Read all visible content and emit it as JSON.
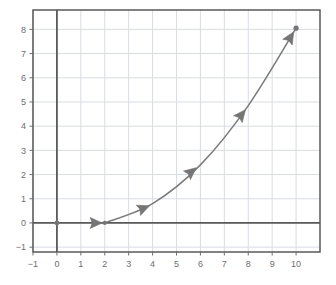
{
  "chart_data": {
    "type": "line",
    "title": "",
    "xlabel": "",
    "ylabel": "",
    "xlim": [
      -1,
      11
    ],
    "ylim": [
      -1.2,
      8.8
    ],
    "xticks": [
      -1,
      0,
      1,
      2,
      3,
      4,
      5,
      6,
      7,
      8,
      9,
      10
    ],
    "yticks": [
      -1,
      0,
      1,
      2,
      3,
      4,
      5,
      6,
      7,
      8
    ],
    "xtick_labels": [
      "−1",
      "0",
      "1",
      "2",
      "3",
      "4",
      "5",
      "6",
      "7",
      "8",
      "9",
      "10"
    ],
    "ytick_labels": [
      "−1",
      "0",
      "1",
      "2",
      "3",
      "4",
      "5",
      "6",
      "7",
      "8"
    ],
    "grid": true,
    "legend": null,
    "series": [
      {
        "name": "curve",
        "marker": "arrow",
        "line_color": "#7a7a7a",
        "x": [
          2,
          4,
          6,
          8,
          10
        ],
        "y": [
          0,
          0.8,
          2.4,
          4.85,
          8.05
        ]
      },
      {
        "name": "isolated-point",
        "marker": "point",
        "line_color": "#7a7a7a",
        "x": [
          0
        ],
        "y": [
          0
        ]
      }
    ],
    "arrow_markers": [
      {
        "x": 1.6,
        "y": 0.0
      },
      {
        "x": 3.6,
        "y": 0.6
      },
      {
        "x": 5.6,
        "y": 2.1
      },
      {
        "x": 7.7,
        "y": 4.45
      },
      {
        "x": 9.75,
        "y": 7.65
      }
    ],
    "colors": {
      "line": "#7a7a7a",
      "marker": "#757575",
      "grid": "#d8dce3",
      "axis": "#5a5a5a",
      "frame": "#4d4d4d",
      "tick_text": "#6e6e6e",
      "background": "#ffffff"
    }
  }
}
